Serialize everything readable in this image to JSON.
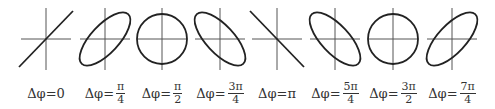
{
  "figure": {
    "stroke_color": "#222222",
    "axis_color": "#555555",
    "panels": [
      {
        "phase": "0",
        "label_prefix": "Δφ=",
        "value": "0",
        "numerator": "",
        "denominator": "",
        "shape": "line-positive",
        "cx": 46
      },
      {
        "phase": "π/4",
        "label_prefix": "Δφ=",
        "value": "",
        "numerator": "π",
        "denominator": "4",
        "shape": "ellipse-positive",
        "cx": 105
      },
      {
        "phase": "π/2",
        "label_prefix": "Δφ=",
        "value": "",
        "numerator": "π",
        "denominator": "2",
        "shape": "circle",
        "cx": 162
      },
      {
        "phase": "3π/4",
        "label_prefix": "Δφ=",
        "value": "",
        "numerator": "3π",
        "denominator": "4",
        "shape": "ellipse-negative",
        "cx": 220
      },
      {
        "phase": "π",
        "label_prefix": "Δφ=",
        "value": "π",
        "numerator": "",
        "denominator": "",
        "shape": "line-negative",
        "cx": 277
      },
      {
        "phase": "5π/4",
        "label_prefix": "Δφ=",
        "value": "",
        "numerator": "5π",
        "denominator": "4",
        "shape": "ellipse-negative",
        "cx": 335
      },
      {
        "phase": "3π/2",
        "label_prefix": "Δφ=",
        "value": "",
        "numerator": "3π",
        "denominator": "2",
        "shape": "circle",
        "cx": 393
      },
      {
        "phase": "7π/4",
        "label_prefix": "Δφ=",
        "value": "",
        "numerator": "7π",
        "denominator": "4",
        "shape": "ellipse-positive",
        "cx": 452
      }
    ]
  }
}
